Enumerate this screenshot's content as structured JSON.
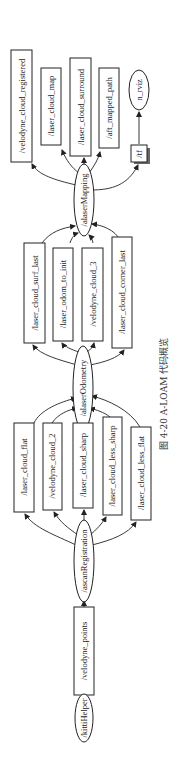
{
  "caption": "图 4-20   A-LOAM 代码概览",
  "colors": {
    "stroke": "#222222",
    "background": "#ffffff",
    "text": "#1a1a1a"
  },
  "nodes": {
    "kittiHelper": "/kittiHelper",
    "scanRegistration": "/ascanRegistration",
    "laserOdometry": "/alaserOdometry",
    "laserMapping": "/alaserMapping",
    "rviz": "n_rviz"
  },
  "topics": {
    "velodyne_points": "/velodyne_points",
    "laser_cloud_flat": "/laser_cloud_flat",
    "velodyne_cloud_2": "/velodyne_cloud_2",
    "laser_cloud_sharp": "/laser_cloud_sharp",
    "laser_cloud_less_sharp": "/laser_cloud_less_sharp",
    "laser_cloud_less_flat": "/laser_cloud_less_flat",
    "laser_cloud_surf_last": "/laser_cloud_surf_last",
    "laser_odom_to_init": "/laser_odom_to_init",
    "velodyne_cloud_3": "/velodyne_cloud_3",
    "laser_cloud_corner_last": "/laser_cloud_corner_last",
    "velodyne_cloud_registered": "/velodyne_cloud_registered",
    "laser_cloud_map": "/laser_cloud_map",
    "laser_cloud_surround": "/laser_cloud_surround",
    "aft_mapped_path": "/aft_mapped_path",
    "tf": "/tf"
  }
}
